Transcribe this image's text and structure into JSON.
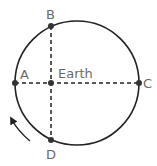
{
  "diagram": {
    "center_label": "Earth",
    "points": [
      {
        "id": "A",
        "label": "A"
      },
      {
        "id": "B",
        "label": "B"
      },
      {
        "id": "C",
        "label": "C"
      },
      {
        "id": "D",
        "label": "D"
      }
    ],
    "direction": "counterclockwise",
    "colors": {
      "line": "#222222",
      "label": "#6a6a6a",
      "background": "#ffffff"
    }
  }
}
